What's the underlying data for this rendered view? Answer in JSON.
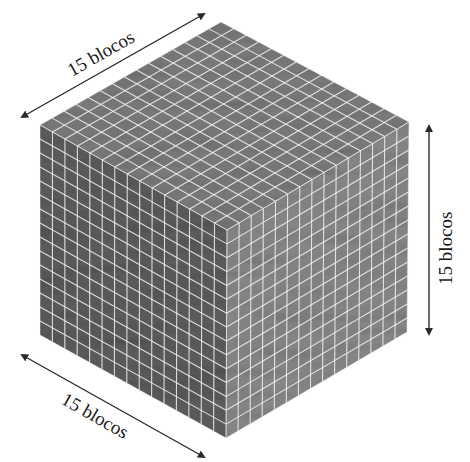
{
  "figure": {
    "blocks_per_edge": 15,
    "labels": {
      "top_edge": "15 blocos",
      "right_edge": "15 blocos",
      "bottom_edge": "15 blocos"
    },
    "colors": {
      "top_face": "#7e7e7e",
      "left_face": "#5e5e5e",
      "right_face": "#8a8a8a",
      "grid_lines": "#f2f2f2",
      "arrow": "#2a2a2a"
    }
  }
}
